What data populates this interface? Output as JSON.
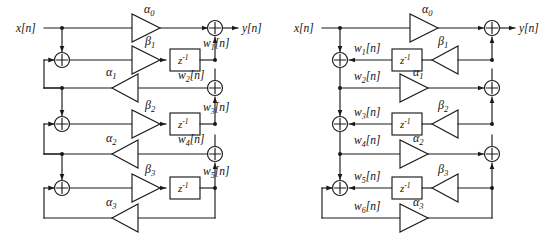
{
  "figure": {
    "kind": "signal-flow-graph-pair",
    "ink_color": "#1a1a1a",
    "background_color": "#ffffff"
  },
  "common": {
    "input_label": "x[n]",
    "output_label": "y[n]",
    "delay_label": "z",
    "delay_exponent": "-1",
    "adder_symbol": "+"
  },
  "left_diagram": {
    "name": "structure-a",
    "input_label": "x[n]",
    "output_label": "y[n]",
    "feed_forward_gains": [
      {
        "symbol": "α",
        "sub": "0"
      },
      {
        "symbol": "β",
        "sub": "1"
      },
      {
        "symbol": "α",
        "sub": "1"
      },
      {
        "symbol": "β",
        "sub": "2"
      },
      {
        "symbol": "α",
        "sub": "2"
      },
      {
        "symbol": "β",
        "sub": "3"
      },
      {
        "symbol": "α",
        "sub": "3"
      }
    ],
    "state_labels": [
      {
        "symbol": "w",
        "sub": "1",
        "index": "[n]"
      },
      {
        "symbol": "w",
        "sub": "2",
        "index": "[n]"
      },
      {
        "symbol": "w",
        "sub": "3",
        "index": "[n]"
      },
      {
        "symbol": "w",
        "sub": "4",
        "index": "[n]"
      },
      {
        "symbol": "w",
        "sub": "5",
        "index": "[n]"
      }
    ],
    "delay_count": 3,
    "adder_count": 6,
    "triangle_count": 7
  },
  "right_diagram": {
    "name": "structure-b",
    "input_label": "x[n]",
    "output_label": "y[n]",
    "feed_forward_gains": [
      {
        "symbol": "α",
        "sub": "0"
      },
      {
        "symbol": "β",
        "sub": "1"
      },
      {
        "symbol": "α",
        "sub": "1"
      },
      {
        "symbol": "β",
        "sub": "2"
      },
      {
        "symbol": "α",
        "sub": "2"
      },
      {
        "symbol": "β",
        "sub": "3"
      },
      {
        "symbol": "α",
        "sub": "3"
      }
    ],
    "state_labels": [
      {
        "symbol": "w",
        "sub": "1",
        "index": "[n]"
      },
      {
        "symbol": "w",
        "sub": "2",
        "index": "[n]"
      },
      {
        "symbol": "w",
        "sub": "3",
        "index": "[n]"
      },
      {
        "symbol": "w",
        "sub": "4",
        "index": "[n]"
      },
      {
        "symbol": "w",
        "sub": "5",
        "index": "[n]"
      },
      {
        "symbol": "w",
        "sub": "6",
        "index": "[n]"
      }
    ],
    "delay_count": 3,
    "adder_count": 6,
    "triangle_count": 7
  }
}
